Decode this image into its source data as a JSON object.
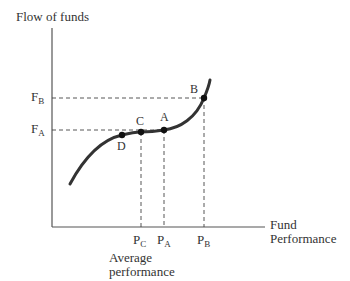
{
  "diagram": {
    "y_axis_label": "Flow of funds",
    "x_axis_label_line1": "Fund",
    "x_axis_label_line2": "Performance",
    "y_ticks": [
      {
        "main": "F",
        "sub": "B"
      },
      {
        "main": "F",
        "sub": "A"
      }
    ],
    "x_ticks": [
      {
        "main": "P",
        "sub": "C"
      },
      {
        "main": "P",
        "sub": "A"
      },
      {
        "main": "P",
        "sub": "B"
      }
    ],
    "points": [
      "A",
      "B",
      "C",
      "D"
    ],
    "annotation_line1": "Average",
    "annotation_line2": "performance",
    "curve_color": "#333333",
    "axis_color": "#555555"
  }
}
